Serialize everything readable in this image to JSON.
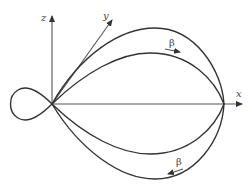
{
  "diagram": {
    "type": "3d-polar-lobe-plot",
    "axes": {
      "x_label": "x",
      "y_label": "y",
      "z_label": "z"
    },
    "annotations": {
      "upper_angle_label": "β",
      "lower_angle_label": "β"
    },
    "colors": {
      "stroke": "#333333",
      "background": "#ffffff"
    }
  }
}
